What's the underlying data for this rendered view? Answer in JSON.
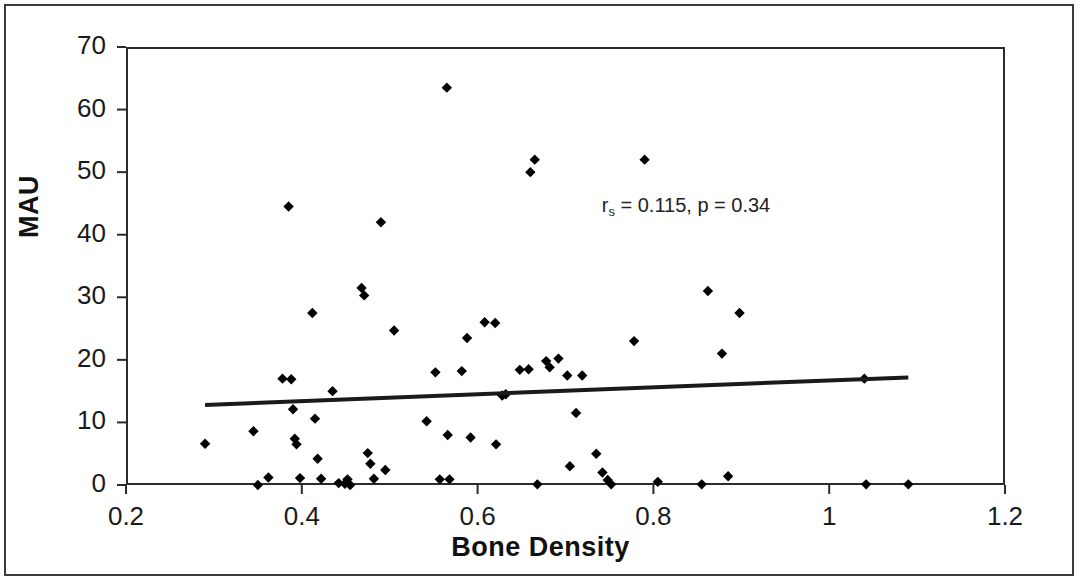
{
  "chart_data": {
    "type": "scatter",
    "title": "",
    "xlabel": "Bone Density",
    "ylabel": "MAU",
    "xlim": [
      0.2,
      1.2
    ],
    "ylim": [
      0,
      70
    ],
    "xticks": [
      "0.2",
      "0.4",
      "0.6",
      "0.8",
      "1",
      "1.2"
    ],
    "xtick_values": [
      0.2,
      0.4,
      0.6,
      0.8,
      1.0,
      1.2
    ],
    "yticks": [
      "0",
      "10",
      "20",
      "30",
      "40",
      "50",
      "60",
      "70"
    ],
    "ytick_values": [
      0,
      10,
      20,
      30,
      40,
      50,
      60,
      70
    ],
    "grid": false,
    "legend": null,
    "marker": "diamond",
    "marker_color": "#000000",
    "annotations": [
      {
        "text_prefix": "r",
        "text_subscript": "s",
        "text_suffix": " = 0.115, p = 0.34",
        "full_text": "rs = 0.115, p = 0.34",
        "x": 0.855,
        "y": 44.5
      }
    ],
    "statistics": {
      "spearman_rs": 0.115,
      "p_value": 0.34
    },
    "trendline": {
      "type": "linear",
      "color": "#1a1a1a",
      "x_start": 0.29,
      "y_start": 12.8,
      "x_end": 1.09,
      "y_end": 17.2
    },
    "points": [
      {
        "x": 0.29,
        "y": 6.6
      },
      {
        "x": 0.345,
        "y": 8.6
      },
      {
        "x": 0.35,
        "y": 0.0
      },
      {
        "x": 0.362,
        "y": 1.2
      },
      {
        "x": 0.378,
        "y": 17.0
      },
      {
        "x": 0.388,
        "y": 16.9
      },
      {
        "x": 0.385,
        "y": 44.5
      },
      {
        "x": 0.39,
        "y": 12.1
      },
      {
        "x": 0.392,
        "y": 7.4
      },
      {
        "x": 0.394,
        "y": 6.5
      },
      {
        "x": 0.398,
        "y": 1.1
      },
      {
        "x": 0.412,
        "y": 27.5
      },
      {
        "x": 0.415,
        "y": 10.6
      },
      {
        "x": 0.418,
        "y": 4.2
      },
      {
        "x": 0.422,
        "y": 1.0
      },
      {
        "x": 0.435,
        "y": 15.0
      },
      {
        "x": 0.442,
        "y": 0.3
      },
      {
        "x": 0.449,
        "y": 0.2
      },
      {
        "x": 0.452,
        "y": 0.9
      },
      {
        "x": 0.455,
        "y": 0.0
      },
      {
        "x": 0.468,
        "y": 31.5
      },
      {
        "x": 0.471,
        "y": 30.3
      },
      {
        "x": 0.475,
        "y": 5.1
      },
      {
        "x": 0.478,
        "y": 3.4
      },
      {
        "x": 0.482,
        "y": 1.0
      },
      {
        "x": 0.49,
        "y": 42.0
      },
      {
        "x": 0.495,
        "y": 2.4
      },
      {
        "x": 0.505,
        "y": 24.7
      },
      {
        "x": 0.542,
        "y": 10.2
      },
      {
        "x": 0.552,
        "y": 18.0
      },
      {
        "x": 0.557,
        "y": 0.9
      },
      {
        "x": 0.565,
        "y": 63.5
      },
      {
        "x": 0.566,
        "y": 8.0
      },
      {
        "x": 0.568,
        "y": 0.9
      },
      {
        "x": 0.582,
        "y": 18.2
      },
      {
        "x": 0.588,
        "y": 23.5
      },
      {
        "x": 0.592,
        "y": 7.6
      },
      {
        "x": 0.608,
        "y": 26.0
      },
      {
        "x": 0.62,
        "y": 25.9
      },
      {
        "x": 0.621,
        "y": 6.5
      },
      {
        "x": 0.628,
        "y": 14.3
      },
      {
        "x": 0.632,
        "y": 14.5
      },
      {
        "x": 0.648,
        "y": 18.4
      },
      {
        "x": 0.658,
        "y": 18.5
      },
      {
        "x": 0.66,
        "y": 50.0
      },
      {
        "x": 0.665,
        "y": 52.0
      },
      {
        "x": 0.668,
        "y": 0.1
      },
      {
        "x": 0.678,
        "y": 19.8
      },
      {
        "x": 0.682,
        "y": 18.8
      },
      {
        "x": 0.692,
        "y": 20.2
      },
      {
        "x": 0.702,
        "y": 17.5
      },
      {
        "x": 0.705,
        "y": 3.0
      },
      {
        "x": 0.712,
        "y": 11.5
      },
      {
        "x": 0.719,
        "y": 17.5
      },
      {
        "x": 0.735,
        "y": 5.0
      },
      {
        "x": 0.742,
        "y": 2.0
      },
      {
        "x": 0.748,
        "y": 0.8
      },
      {
        "x": 0.752,
        "y": 0.1
      },
      {
        "x": 0.778,
        "y": 23.0
      },
      {
        "x": 0.79,
        "y": 52.0
      },
      {
        "x": 0.805,
        "y": 0.5
      },
      {
        "x": 0.855,
        "y": 0.1
      },
      {
        "x": 0.862,
        "y": 31.0
      },
      {
        "x": 0.878,
        "y": 21.0
      },
      {
        "x": 0.885,
        "y": 1.4
      },
      {
        "x": 0.898,
        "y": 27.5
      },
      {
        "x": 1.04,
        "y": 17.0
      },
      {
        "x": 1.042,
        "y": 0.1
      },
      {
        "x": 1.09,
        "y": 0.1
      }
    ]
  }
}
